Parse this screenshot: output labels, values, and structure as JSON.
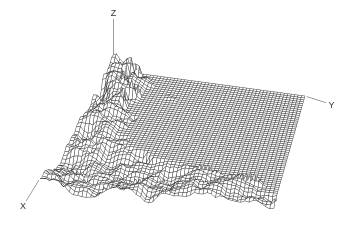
{
  "figure": {
    "background": "#ffffff",
    "kind": "3D hidden-line wireframe surface plot, dark gray lines on white"
  },
  "chart_data": {
    "type": "surface",
    "subtype": "3d-wireframe-mesh",
    "title": "",
    "axis_labels": {
      "x": "X",
      "y": "Y",
      "z": "Z"
    },
    "axis_ticks": "none",
    "legend": "none",
    "style": {
      "stroke": "#3d3d3d",
      "fill": "#ffffff",
      "background": "#ffffff",
      "line_width": 0.5,
      "label_color": "#333333",
      "label_font_px": 9
    },
    "grid": {
      "cells_u": 56,
      "cells_v": 56
    },
    "projection_corners": {
      "back": [
        113,
        72
      ],
      "right": [
        305,
        98
      ],
      "left": [
        40,
        183
      ],
      "front": [
        274,
        207
      ]
    },
    "axes_screen": {
      "z_label_xy": [
        113.5,
        12.5
      ],
      "y_label_xy": [
        331.5,
        104.5
      ],
      "x_label_xy": [
        23,
        206
      ],
      "z_line_top_y": 19,
      "z_line_bottom_y": 112,
      "axis_gap_px": 6,
      "axis_start_offset_px": 2
    },
    "surface_model": {
      "plane_height_px": 2,
      "base_amplitude_px": 10,
      "noise_gain": 1.4,
      "soft_clamp_px": {
        "up": 36,
        "down": 20
      },
      "noise_octaves": [
        {
          "f": 5.5,
          "w": 0.5,
          "ox": 1.7,
          "oy": 9.2
        },
        {
          "f": 13,
          "w": 0.28,
          "ox": 7.3,
          "oy": 2.1
        },
        {
          "f": 27,
          "w": 0.22,
          "ox": 3.7,
          "oy": 9.7
        },
        {
          "f": 51,
          "w": 0.12,
          "ox": 1.1,
          "oy": 5.5
        }
      ],
      "back_left_peak": {
        "u": 0.08,
        "v": 0.09,
        "su": 0.16,
        "sv": 0.2,
        "bias_px": 16,
        "amp_px": 10
      },
      "left_edge_boost": {
        "amplitude_px": 6,
        "sigma_v": 0.22
      },
      "front_boost": {
        "u": 0.8,
        "amplitude_px": 2.5,
        "sigma_u": 0.25
      },
      "flat_boundary_v_of_u": [
        [
          0.0,
          0.1
        ],
        [
          0.62,
          0.26
        ],
        [
          0.75,
          0.6
        ],
        [
          0.83,
          0.93
        ],
        [
          0.9,
          0.97
        ],
        [
          1.0,
          1.35
        ]
      ],
      "boundary_wave": {
        "amplitude": 0.03,
        "freq1": 5,
        "freq2": 11
      },
      "flat_max_u": 0.93,
      "poke_threshold_px": 15,
      "poke_band_v": 0.25,
      "poke_falloff_px_per_v": 40,
      "poke_clusters": [
        {
          "u": 0.55,
          "v": 0.85,
          "amp_px": 13,
          "su": 0.14,
          "sv": 0.16
        },
        {
          "u": 0.2,
          "v": 0.4,
          "amp_px": 9,
          "su": 0.17,
          "sv": 0.22
        },
        {
          "u": 0.35,
          "v": 0.6,
          "amp_px": 8,
          "su": 0.14,
          "sv": 0.17
        }
      ]
    }
  }
}
